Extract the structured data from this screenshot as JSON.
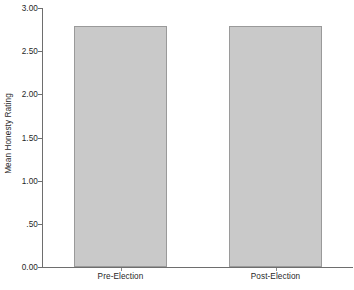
{
  "chart_data": {
    "type": "bar",
    "title": "",
    "subtitle": "",
    "xlabel": "",
    "ylabel": "Mean Honesty Rating",
    "categories": [
      "Pre-Election",
      "Post-Election"
    ],
    "values": [
      2.79,
      2.79
    ],
    "series": [
      {
        "name": "Mean Honesty Rating",
        "values": [
          2.79,
          2.79
        ]
      }
    ],
    "ylim": [
      0.0,
      3.0
    ],
    "y_ticks": [
      0.0,
      0.5,
      1.0,
      1.5,
      2.0,
      2.5,
      3.0
    ],
    "y_tick_labels": [
      "0.00",
      ".50",
      "1.00",
      "1.50",
      "2.00",
      "2.50",
      "3.00"
    ],
    "grid": false,
    "legend": null,
    "legend_position": "none",
    "bar_fill_color": "#c9c9c9",
    "bar_border_color": "#9a9a9a",
    "axis_color": "#6e6e6e",
    "background_color": "#ffffff",
    "annotations": []
  },
  "axes": {
    "y_title": "Mean Honesty Rating"
  }
}
